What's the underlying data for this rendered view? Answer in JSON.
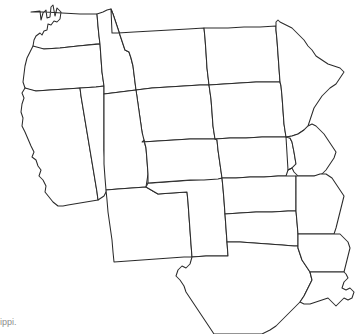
{
  "map": {
    "title": "Blank outline map of the western and central United States",
    "background_color": "#ffffff",
    "outline_color": "#2b2b2b",
    "outline_width_px": 1,
    "fill_color": "#ffffff",
    "projection_hint": "conic, North America",
    "coverage": "Pacific coast east to the Mississippi River",
    "labels_visible": false,
    "states": [
      {
        "id": "WA",
        "name": "Washington"
      },
      {
        "id": "OR",
        "name": "Oregon"
      },
      {
        "id": "CA",
        "name": "California"
      },
      {
        "id": "NV",
        "name": "Nevada"
      },
      {
        "id": "ID",
        "name": "Idaho"
      },
      {
        "id": "MT",
        "name": "Montana"
      },
      {
        "id": "WY",
        "name": "Wyoming"
      },
      {
        "id": "UT",
        "name": "Utah"
      },
      {
        "id": "AZ",
        "name": "Arizona"
      },
      {
        "id": "CO",
        "name": "Colorado"
      },
      {
        "id": "NM",
        "name": "New Mexico"
      },
      {
        "id": "ND",
        "name": "North Dakota"
      },
      {
        "id": "SD",
        "name": "South Dakota"
      },
      {
        "id": "NE",
        "name": "Nebraska"
      },
      {
        "id": "KS",
        "name": "Kansas"
      },
      {
        "id": "OK",
        "name": "Oklahoma"
      },
      {
        "id": "TX",
        "name": "Texas"
      },
      {
        "id": "MN",
        "name": "Minnesota"
      },
      {
        "id": "IA",
        "name": "Iowa"
      },
      {
        "id": "MO",
        "name": "Missouri"
      },
      {
        "id": "AR",
        "name": "Arkansas"
      },
      {
        "id": "LA",
        "name": "Louisiana"
      }
    ]
  },
  "caption": {
    "text": "ippi.",
    "note": "truncated text clipped at the left edge of the frame",
    "color": "#8d8d8d"
  }
}
